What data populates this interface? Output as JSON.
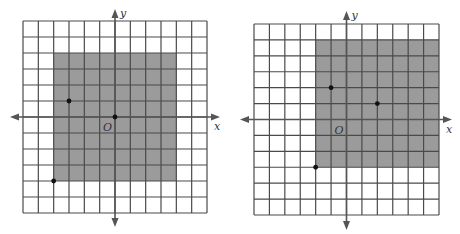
{
  "colors": {
    "background": "#ffffff",
    "grid_line": "#4a4a4a",
    "shade": "#9b9b9b",
    "axis": "#555555",
    "point": "#111111"
  },
  "figures": [
    {
      "id": "left",
      "range": {
        "xmin": -6,
        "xmax": 6,
        "ymin": -6,
        "ymax": 6
      },
      "pixel_box": {
        "left": 23,
        "top": 21,
        "right": 207,
        "bottom": 213
      },
      "axis_arrows": {
        "x_left": 10,
        "x_right": 220,
        "y_top": 9,
        "y_bottom": 227
      },
      "shaded_region": {
        "xmin": -4,
        "xmax": 4,
        "ymin": -4,
        "ymax": 4
      },
      "points": [
        {
          "x": -3,
          "y": 1
        },
        {
          "x": 0,
          "y": 0
        },
        {
          "x": -4,
          "y": -4
        }
      ],
      "labels": {
        "x_axis": "x",
        "y_axis": "y",
        "origin": "O"
      }
    },
    {
      "id": "right",
      "range": {
        "xmin": -6,
        "xmax": 6,
        "ymin": -6,
        "ymax": 6
      },
      "pixel_box": {
        "left": 254,
        "top": 24,
        "right": 439,
        "bottom": 215
      },
      "axis_arrows": {
        "x_left": 240,
        "x_right": 452,
        "y_top": 11,
        "y_bottom": 230
      },
      "shaded_region": {
        "xmin": -2,
        "xmax": 6,
        "ymin": -3,
        "ymax": 5
      },
      "points": [
        {
          "x": -1,
          "y": 2
        },
        {
          "x": 2,
          "y": 1
        },
        {
          "x": -2,
          "y": -3
        }
      ],
      "labels": {
        "x_axis": "x",
        "y_axis": "y",
        "origin": "O"
      }
    }
  ]
}
